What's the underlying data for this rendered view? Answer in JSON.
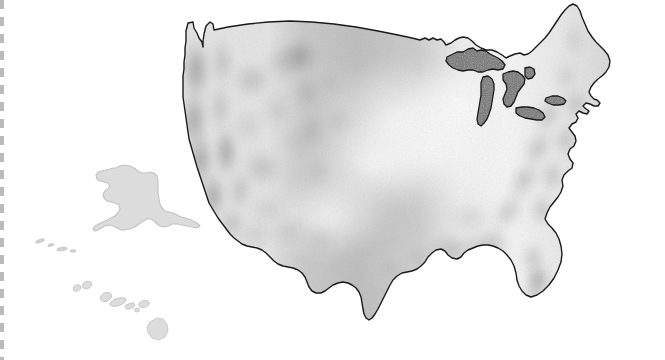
{
  "figure": {
    "kind": "map",
    "background_color": "#ffffff",
    "width": 665,
    "height": 360
  },
  "palette": {
    "background": "#ffffff",
    "outline": "#1a1a1a",
    "land_light": "#f2f2f2",
    "land_mid": "#d6d6d6",
    "land_dark": "#b4b4b4",
    "relief_shadow": "#9a9a9a",
    "lake_fill": "#6f6f6f",
    "offshore_state_fill": "#dcdcdc",
    "offshore_state_outline": "#c2c2c2",
    "edge_strip": "#969696"
  },
  "map_data": {
    "type": "choropleth-relief",
    "projection": "albers-usa",
    "regions": [
      {
        "name": "conterminous-united-states",
        "label": "Contiguous United States",
        "outlined": true,
        "fill": "graded-relief",
        "shading": "light in the Great Plains and interior lowlands, medium-dark over the western mountains, medium over the Appalachians, Gulf Coast and Florida"
      },
      {
        "name": "alaska",
        "label": "Alaska",
        "outlined": false,
        "fill": "#dcdcdc",
        "inset_position": "lower-left"
      },
      {
        "name": "hawaii",
        "label": "Hawaii",
        "outlined": false,
        "fill": "#dcdcdc",
        "inset_position": "bottom-left"
      },
      {
        "name": "great-lakes",
        "label": "Great Lakes",
        "outlined": true,
        "fill": "#6f6f6f",
        "members": [
          "Lake Superior",
          "Lake Michigan",
          "Lake Huron",
          "Lake Erie",
          "Lake Ontario"
        ]
      }
    ],
    "relief_zones": [
      {
        "name": "pacific-coast-ranges",
        "intensity": "dark",
        "position": "west coast"
      },
      {
        "name": "cascade-sierra",
        "intensity": "dark",
        "position": "far west interior"
      },
      {
        "name": "rocky-mountains",
        "intensity": "medium-dark",
        "position": "west-central"
      },
      {
        "name": "great-basin",
        "intensity": "medium",
        "position": "interior west"
      },
      {
        "name": "great-plains",
        "intensity": "light",
        "position": "center"
      },
      {
        "name": "interior-lowlands",
        "intensity": "very-light",
        "position": "center-east"
      },
      {
        "name": "appalachian-mountains",
        "intensity": "medium",
        "position": "east"
      },
      {
        "name": "gulf-coastal-plain",
        "intensity": "medium",
        "position": "southeast"
      },
      {
        "name": "florida-peninsula",
        "intensity": "medium-dark",
        "position": "southeast tip"
      },
      {
        "name": "atlantic-coastal-plain",
        "intensity": "medium",
        "position": "east coast"
      },
      {
        "name": "new-england",
        "intensity": "medium",
        "position": "northeast"
      }
    ],
    "annotations": [],
    "legend": null,
    "scalebar": null,
    "labels_visible": false
  },
  "edge_marks": {
    "left_strip": {
      "name": "scan-edge-dashes",
      "description": "faint gray dashed vertical band at the left margin of the scanned page"
    }
  }
}
